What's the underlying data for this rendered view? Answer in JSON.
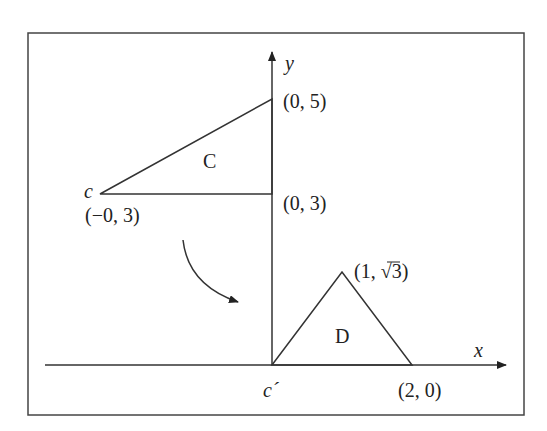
{
  "diagram": {
    "axes": {
      "x_label": "x",
      "y_label": "y"
    },
    "triangle_c": {
      "name": "C",
      "vertices": [
        {
          "label": "c",
          "coord": "(−0, 3)"
        },
        {
          "label": "",
          "coord": "(0, 5)"
        },
        {
          "label": "",
          "coord": "(0, 3)"
        }
      ]
    },
    "triangle_d": {
      "name": "D",
      "vertices": [
        {
          "label": "c´",
          "coord": ""
        },
        {
          "label": "",
          "coord": "(1, √3)"
        },
        {
          "label": "",
          "coord": "(2, 0)"
        }
      ]
    },
    "labels": {
      "c": "c",
      "c_prime": "c´",
      "c_coord": "(−0, 3)",
      "p05": "(0, 5)",
      "p03": "(0, 3)",
      "p1r3_pre": "(1, ",
      "p1r3_root": "√3",
      "p1r3_post": ")",
      "p20": "(2, 0)",
      "C": "C",
      "D": "D",
      "x": "x",
      "y": "y"
    },
    "colors": {
      "line": "#333333",
      "frame": "#444444",
      "background": "#ffffff"
    }
  }
}
